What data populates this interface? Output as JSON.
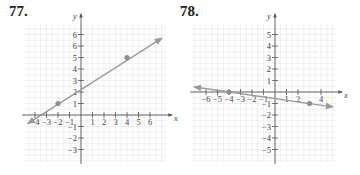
{
  "problems": [
    {
      "number": "77."
    },
    {
      "number": "78."
    }
  ],
  "chart_data": [
    {
      "type": "line",
      "title": "77.",
      "xlabel": "x",
      "ylabel": "y",
      "xlim": [
        -5,
        7
      ],
      "ylim": [
        -4,
        8
      ],
      "grid": true,
      "x_tick_labels": [
        "−4",
        "−3",
        "−2",
        "−1",
        "1",
        "2",
        "3",
        "4",
        "5",
        "6"
      ],
      "x_ticks": [
        -4,
        -3,
        -2,
        -1,
        1,
        2,
        3,
        4,
        5,
        6
      ],
      "y_tick_labels": [
        "6",
        "6",
        "5",
        "4",
        "3",
        "2",
        "1",
        "−1",
        "−2",
        "−3"
      ],
      "y_ticks": [
        7,
        6,
        5,
        4,
        3,
        2,
        1,
        -1,
        -2,
        -3
      ],
      "points": [
        {
          "x": -2,
          "y": 1
        },
        {
          "x": 4,
          "y": 5
        }
      ],
      "line": {
        "x1": -4.6,
        "y1": -0.73,
        "x2": 7.0,
        "y2": 6.67,
        "arrows": "both"
      },
      "layout": {
        "origin_px": [
          81,
          115
        ],
        "unit_px": 11.5,
        "grid_px": [
          24,
          24,
          166,
          162
        ]
      }
    },
    {
      "type": "line",
      "title": "78.",
      "xlabel": "x",
      "ylabel": "y",
      "xlim": [
        -7,
        5
      ],
      "ylim": [
        -6,
        6
      ],
      "grid": true,
      "x_tick_labels": [
        "−6",
        "−5",
        "−4",
        "−3",
        "−2",
        "−1",
        "1",
        "2",
        "4"
      ],
      "x_ticks": [
        -6,
        -5,
        -4,
        -3,
        -2,
        -1,
        1,
        2,
        4
      ],
      "y_tick_labels": [
        "5",
        "4",
        "3",
        "2",
        "1",
        "−1",
        "−2",
        "−3",
        "−4",
        "−5"
      ],
      "y_ticks": [
        5,
        4,
        3,
        2,
        1,
        -1,
        -2,
        -3,
        -4,
        -5
      ],
      "points": [
        {
          "x": -4,
          "y": 0
        },
        {
          "x": 3,
          "y": -1
        }
      ],
      "line": {
        "x1": -7.0,
        "y1": 0.43,
        "x2": 5.0,
        "y2": -1.29,
        "arrows": "both"
      },
      "layout": {
        "origin_px": [
          275,
          92
        ],
        "unit_px": 11.5,
        "grid_px": [
          192,
          24,
          336,
          162
        ]
      }
    }
  ],
  "colors": {
    "grid": "#e6e6e6",
    "axis": "#555555",
    "line": "#9a9a9a",
    "point": "#8e8e8e"
  }
}
